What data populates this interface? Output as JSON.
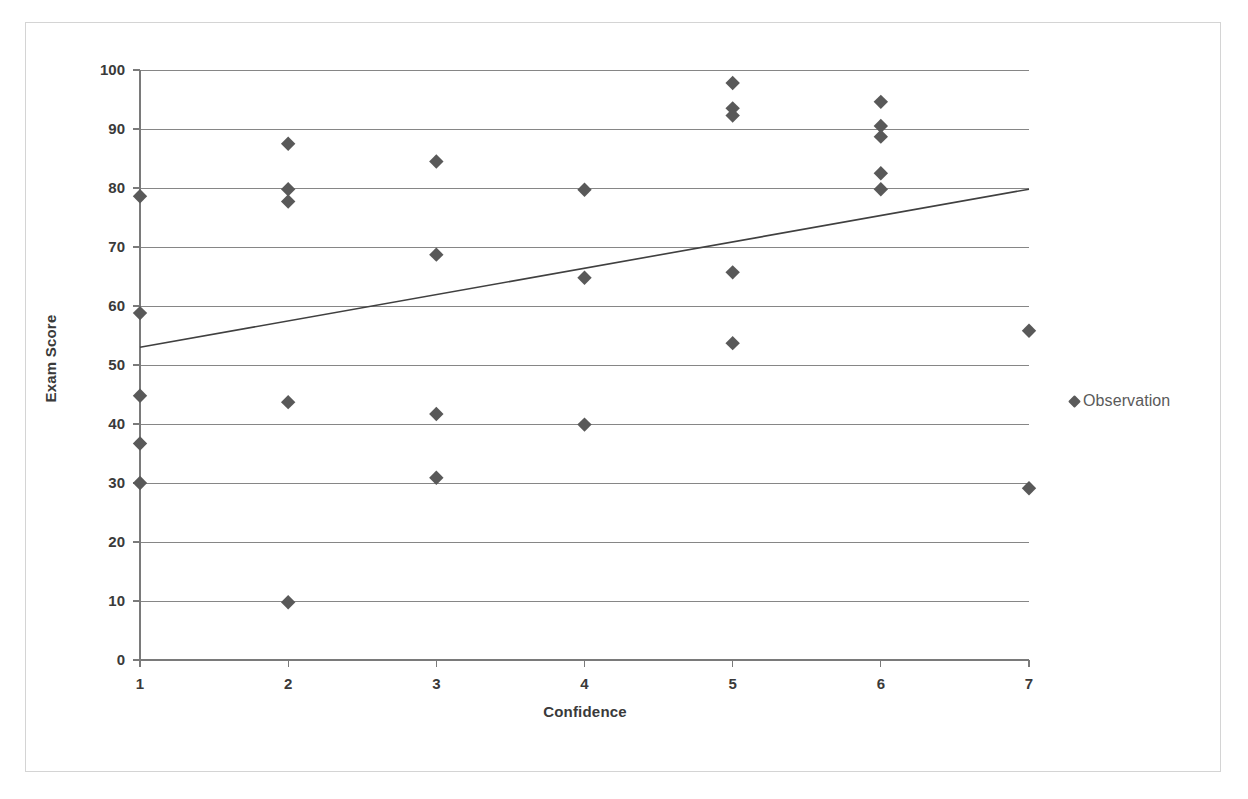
{
  "chart_data": {
    "type": "scatter",
    "title": "",
    "xlabel": "Confidence",
    "ylabel": "Exam Score",
    "xlim": [
      1,
      7
    ],
    "ylim": [
      0,
      100
    ],
    "xticks": [
      1,
      2,
      3,
      4,
      5,
      6,
      7
    ],
    "yticks": [
      0,
      10,
      20,
      30,
      40,
      50,
      60,
      70,
      80,
      90,
      100
    ],
    "grid": "horizontal",
    "legend_position": "right",
    "series": [
      {
        "name": "Observation",
        "marker": "diamond",
        "color": "#595959",
        "points": [
          {
            "x": 1,
            "y": 78.6
          },
          {
            "x": 1,
            "y": 58.8
          },
          {
            "x": 1,
            "y": 44.8
          },
          {
            "x": 1,
            "y": 36.7
          },
          {
            "x": 1,
            "y": 30.0
          },
          {
            "x": 2,
            "y": 87.5
          },
          {
            "x": 2,
            "y": 79.8
          },
          {
            "x": 2,
            "y": 77.7
          },
          {
            "x": 2,
            "y": 43.7
          },
          {
            "x": 2,
            "y": 9.8
          },
          {
            "x": 3,
            "y": 84.5
          },
          {
            "x": 3,
            "y": 68.7
          },
          {
            "x": 3,
            "y": 41.7
          },
          {
            "x": 3,
            "y": 30.9
          },
          {
            "x": 4,
            "y": 79.7
          },
          {
            "x": 4,
            "y": 64.8
          },
          {
            "x": 4,
            "y": 39.9
          },
          {
            "x": 5,
            "y": 97.8
          },
          {
            "x": 5,
            "y": 93.5
          },
          {
            "x": 5,
            "y": 92.3
          },
          {
            "x": 5,
            "y": 65.7
          },
          {
            "x": 5,
            "y": 53.7
          },
          {
            "x": 6,
            "y": 94.6
          },
          {
            "x": 6,
            "y": 90.5
          },
          {
            "x": 6,
            "y": 88.7
          },
          {
            "x": 6,
            "y": 82.5
          },
          {
            "x": 6,
            "y": 79.8
          },
          {
            "x": 7,
            "y": 55.8
          },
          {
            "x": 7,
            "y": 29.1
          }
        ]
      }
    ],
    "trendline": {
      "name": "linear-fit",
      "color": "#404040",
      "x_start": 1,
      "y_start": 53.0,
      "x_end": 7,
      "y_end": 79.8
    }
  },
  "legend": {
    "entries": [
      {
        "label": "Observation",
        "marker": "diamond"
      }
    ]
  },
  "axes": {
    "x_title": "Confidence",
    "y_title": "Exam Score",
    "x_tick_labels": [
      "1",
      "2",
      "3",
      "4",
      "5",
      "6",
      "7"
    ],
    "y_tick_labels": [
      "0",
      "10",
      "20",
      "30",
      "40",
      "50",
      "60",
      "70",
      "80",
      "90",
      "100"
    ]
  },
  "colors": {
    "marker": "#595959",
    "gridline": "#868686",
    "axis": "#7a7a7a",
    "trendline": "#404040",
    "frame_border": "#d4d4d4",
    "text": "#3a3a3a"
  }
}
